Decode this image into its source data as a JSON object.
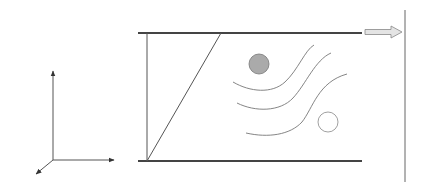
{
  "diagram": {
    "axes": {
      "x_label": "x",
      "y_label": "y",
      "z_label": "z"
    },
    "velocity_profile": {
      "type": "linear",
      "arrow_count": 5
    },
    "top_plate": {
      "motion": "moving",
      "direction": "right"
    },
    "bottom_plate": {
      "motion": "stationary"
    },
    "particles": [
      {
        "name": "filled-particle",
        "fill": "#aaaaaa"
      },
      {
        "name": "hollow-particle",
        "fill": "#ffffff"
      }
    ],
    "streamline_count": 3,
    "colors": {
      "line": "#555555",
      "plate": "#444444",
      "hatch": "#777777"
    }
  }
}
